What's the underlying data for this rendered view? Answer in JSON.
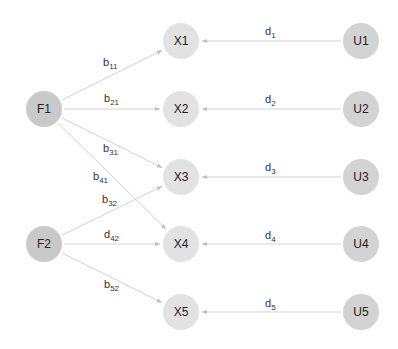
{
  "diagram": {
    "type": "factor-model-path-diagram",
    "colors": {
      "factor_fill": "#c9c9c9",
      "indicator_fill": "#e2e2e2",
      "unique_fill": "#d3d3d3",
      "edge": "#d2d2d2",
      "arrowhead": "#bdbdbd",
      "text": "#222222"
    },
    "nodes": [
      {
        "id": "F1",
        "label": "F1",
        "kind": "factor",
        "x": 44,
        "y": 109
      },
      {
        "id": "F2",
        "label": "F2",
        "kind": "factor",
        "x": 44,
        "y": 244
      },
      {
        "id": "X1",
        "label": "X1",
        "kind": "indicator",
        "x": 181,
        "y": 41
      },
      {
        "id": "X2",
        "label": "X2",
        "kind": "indicator",
        "x": 181,
        "y": 109
      },
      {
        "id": "X3",
        "label": "X3",
        "kind": "indicator",
        "x": 181,
        "y": 177
      },
      {
        "id": "X4",
        "label": "X4",
        "kind": "indicator",
        "x": 181,
        "y": 244
      },
      {
        "id": "X5",
        "label": "X5",
        "kind": "indicator",
        "x": 181,
        "y": 312
      },
      {
        "id": "U1",
        "label": "U1",
        "kind": "unique",
        "x": 361,
        "y": 41
      },
      {
        "id": "U2",
        "label": "U2",
        "kind": "unique",
        "x": 361,
        "y": 109
      },
      {
        "id": "U3",
        "label": "U3",
        "kind": "unique",
        "x": 361,
        "y": 177
      },
      {
        "id": "U4",
        "label": "U4",
        "kind": "unique",
        "x": 361,
        "y": 244
      },
      {
        "id": "U5",
        "label": "U5",
        "kind": "unique",
        "x": 361,
        "y": 312
      }
    ],
    "edges": [
      {
        "from": "F1",
        "to": "X1",
        "label_base": "b",
        "label_sub": "11",
        "lx": 103,
        "ly": 66
      },
      {
        "from": "F1",
        "to": "X2",
        "label_base": "b",
        "label_sub": "21",
        "lx": 104,
        "ly": 102
      },
      {
        "from": "F1",
        "to": "X3",
        "label_base": "b",
        "label_sub": "31",
        "lx": 103,
        "ly": 152
      },
      {
        "from": "F1",
        "to": "X4",
        "label_base": "b",
        "label_sub": "41",
        "lx": 93,
        "ly": 180
      },
      {
        "from": "F2",
        "to": "X3",
        "label_base": "b",
        "label_sub": "32",
        "lx": 102,
        "ly": 203
      },
      {
        "from": "F2",
        "to": "X4",
        "label_base": "d",
        "label_sub": "42",
        "lx": 104,
        "ly": 238
      },
      {
        "from": "F2",
        "to": "X5",
        "label_base": "b",
        "label_sub": "52",
        "lx": 104,
        "ly": 288
      },
      {
        "from": "U1",
        "to": "X1",
        "label_base": "d",
        "label_sub": "1",
        "lx": 265,
        "ly": 35
      },
      {
        "from": "U2",
        "to": "X2",
        "label_base": "d",
        "label_sub": "2",
        "lx": 265,
        "ly": 103
      },
      {
        "from": "U3",
        "to": "X3",
        "label_base": "d",
        "label_sub": "3",
        "lx": 265,
        "ly": 171
      },
      {
        "from": "U4",
        "to": "X4",
        "label_base": "d",
        "label_sub": "4",
        "lx": 265,
        "ly": 239
      },
      {
        "from": "U5",
        "to": "X5",
        "label_base": "d",
        "label_sub": "5",
        "lx": 265,
        "ly": 307
      }
    ],
    "node_radius": 18
  }
}
